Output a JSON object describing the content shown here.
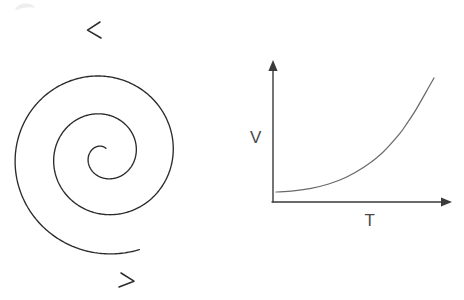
{
  "figure": {
    "background_color": "#ffffff",
    "ink_color": "#2b2b2b",
    "curve_color": "#6a6a6a",
    "width": 464,
    "height": 300
  },
  "spiral": {
    "name": "double-ended-spiral",
    "description": "Hand-drawn Archimedean spiral unwinding from a small central loop to two long outer sweeps terminating in arrowheads",
    "center_x": 104,
    "center_y": 155,
    "turns": 2.6,
    "inner_radius": 7,
    "outer_radius": 101,
    "rotation_sense": "counterclockwise-outward",
    "arrows": [
      {
        "name": "spiral-arrow-top",
        "label": "upper arrowhead pointing left",
        "tip_x": 88,
        "tip_y": 30,
        "direction": "left"
      },
      {
        "name": "spiral-arrow-bottom",
        "label": "lower arrowhead pointing right",
        "tip_x": 134,
        "tip_y": 281,
        "direction": "right"
      }
    ]
  },
  "chart_data": {
    "type": "line",
    "title": "",
    "xlabel": "T",
    "ylabel": "V",
    "grid": false,
    "legend": false,
    "axis_arrows": true,
    "xlim": [
      0,
      10
    ],
    "ylim": [
      0,
      10
    ],
    "annotations": [],
    "series": [
      {
        "name": "V vs T",
        "shape": "exponential-growth",
        "x": [
          0.0,
          1.0,
          2.0,
          3.0,
          4.0,
          5.0,
          6.0,
          7.0,
          7.5,
          8.0,
          8.6,
          9.0
        ],
        "values": [
          0.75,
          0.85,
          1.05,
          1.4,
          1.95,
          2.75,
          3.85,
          5.4,
          6.4,
          7.5,
          9.0,
          10.0
        ]
      }
    ],
    "geometry": {
      "origin_x": 273,
      "origin_y": 202,
      "y_axis_top_y": 62,
      "x_axis_right_x": 451,
      "curve_start_x": 276,
      "curve_start_y": 192,
      "curve_end_x": 434,
      "curve_end_y": 78,
      "ylabel_x": 256,
      "ylabel_y": 143,
      "xlabel_x": 370,
      "xlabel_y": 226
    }
  },
  "artifacts": {
    "corner_smudge": {
      "name": "scan-smudge",
      "x": 14,
      "y": 3,
      "width": 22,
      "height": 8
    }
  }
}
